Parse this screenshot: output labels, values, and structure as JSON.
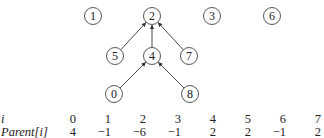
{
  "diagram": {
    "nodes": [
      {
        "id": "1",
        "label": "1",
        "x": 93,
        "y": 16
      },
      {
        "id": "2",
        "label": "2",
        "x": 152,
        "y": 16
      },
      {
        "id": "3",
        "label": "3",
        "x": 212,
        "y": 16
      },
      {
        "id": "6",
        "label": "6",
        "x": 272,
        "y": 16
      },
      {
        "id": "5",
        "label": "5",
        "x": 115,
        "y": 56
      },
      {
        "id": "4",
        "label": "4",
        "x": 152,
        "y": 56
      },
      {
        "id": "7",
        "label": "7",
        "x": 189,
        "y": 56
      },
      {
        "id": "0",
        "label": "0",
        "x": 114,
        "y": 94
      },
      {
        "id": "8",
        "label": "8",
        "x": 190,
        "y": 94
      }
    ],
    "edges": [
      {
        "from": "5",
        "to": "2"
      },
      {
        "from": "4",
        "to": "2"
      },
      {
        "from": "7",
        "to": "2"
      },
      {
        "from": "0",
        "to": "4"
      },
      {
        "from": "8",
        "to": "4"
      }
    ]
  },
  "table": {
    "row_labels": {
      "index": "i",
      "parent": "Parent[i]"
    },
    "index": [
      "0",
      "1",
      "2",
      "3",
      "4",
      "5",
      "6",
      "7"
    ],
    "parent": [
      "4",
      "−1",
      "−6",
      "−1",
      "2",
      "2",
      "−1",
      "2"
    ]
  }
}
